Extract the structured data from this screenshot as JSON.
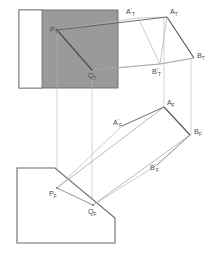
{
  "figure": {
    "background_color": "#ffffff",
    "stroke_dark": "#6b6b6b",
    "stroke_mid": "#8f8f8f",
    "stroke_light": "#b5b5b5",
    "fill_gray": "#9a9a9a",
    "fill_white": "#ffffff"
  },
  "top_view": {
    "name": "top-view",
    "shaded_rectangle": {
      "x": 19,
      "y": 10,
      "width": 99,
      "height": 78,
      "fill": "#9a9a9a",
      "white_strip": {
        "x": 19,
        "y": 10,
        "width": 23,
        "height": 78,
        "fill": "#ffffff"
      }
    },
    "quadrilateral_points": "57,30 138,18 167,17 194,58 160,64 92,70",
    "labels": [
      {
        "id": "P_T",
        "base": "P",
        "sub": "T",
        "prime": "",
        "x": 50,
        "y": 32
      },
      {
        "id": "Q_T",
        "base": "Q",
        "sub": "T",
        "prime": "",
        "x": 88,
        "y": 78
      },
      {
        "id": "A'_T",
        "base": "A",
        "sub": "T",
        "prime": "'",
        "x": 126,
        "y": 14
      },
      {
        "id": "A_T",
        "base": "A",
        "sub": "T",
        "prime": "",
        "x": 170,
        "y": 14
      },
      {
        "id": "B'_T",
        "base": "B",
        "sub": "T",
        "prime": "'",
        "x": 152,
        "y": 74
      },
      {
        "id": "B_T",
        "base": "B",
        "sub": "T",
        "prime": "",
        "x": 197,
        "y": 58
      }
    ]
  },
  "front_view": {
    "name": "front-view",
    "polygon_points": "17,168 55,168 115,218 115,243 17,243",
    "rotated_rectangle_points": "164,107 190,135 93,205 57,188",
    "labels": [
      {
        "id": "P_F",
        "base": "P",
        "sub": "F",
        "prime": "",
        "x": 49,
        "y": 196
      },
      {
        "id": "Q_F",
        "base": "Q",
        "sub": "F",
        "prime": "",
        "x": 88,
        "y": 214
      },
      {
        "id": "A'_F",
        "base": "A",
        "sub": "F",
        "prime": "'",
        "x": 113,
        "y": 125
      },
      {
        "id": "A_F",
        "base": "A",
        "sub": "F",
        "prime": "",
        "x": 167,
        "y": 105
      },
      {
        "id": "B'_F",
        "base": "B",
        "sub": "F",
        "prime": "'",
        "x": 150,
        "y": 170
      },
      {
        "id": "B_F",
        "base": "B",
        "sub": "F",
        "prime": "",
        "x": 194,
        "y": 134
      }
    ]
  },
  "projectors": [
    {
      "id": "projector-P",
      "x1": 57,
      "y1": 30,
      "x2": 57,
      "y2": 190
    },
    {
      "id": "projector-Q",
      "x1": 92,
      "y1": 70,
      "x2": 92,
      "y2": 207
    },
    {
      "id": "projector-A",
      "x1": 164,
      "y1": 17,
      "x2": 164,
      "y2": 108
    },
    {
      "id": "projector-B",
      "x1": 191,
      "y1": 58,
      "x2": 191,
      "y2": 136
    }
  ]
}
